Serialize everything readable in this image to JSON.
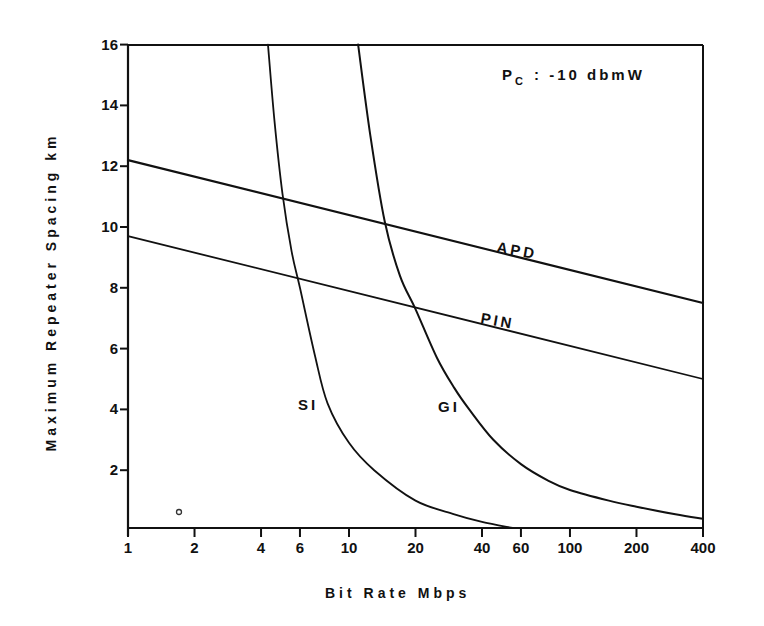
{
  "chart_data": {
    "type": "line",
    "title": "",
    "annotation": {
      "text_main": "P",
      "text_sub": "C",
      "text_rest": ": -10 dbmW"
    },
    "xlabel": "Bit Rate Mbps",
    "ylabel": "Maximum Repeater Spacing km",
    "xscale": "log",
    "xlim": [
      1,
      400
    ],
    "ylim": [
      0,
      16
    ],
    "x_ticks": [
      1,
      2,
      4,
      6,
      10,
      20,
      40,
      60,
      100,
      200,
      400
    ],
    "x_tick_labels": [
      "1",
      "2",
      "4",
      "6",
      "10",
      "20",
      "40",
      "60",
      "100",
      "200",
      "400"
    ],
    "y_ticks": [
      2,
      4,
      6,
      8,
      10,
      12,
      14,
      16
    ],
    "y_tick_labels": [
      "2",
      "4",
      "6",
      "8",
      "10",
      "12",
      "14",
      "16"
    ],
    "grid": false,
    "legend": "none (inline labels)",
    "series": [
      {
        "name": "APD",
        "x": [
          1,
          400
        ],
        "y": [
          12.2,
          7.5
        ]
      },
      {
        "name": "PIN",
        "x": [
          1,
          400
        ],
        "y": [
          9.7,
          5.0
        ]
      },
      {
        "name": "SI",
        "x": [
          4.3,
          4.6,
          5.0,
          5.5,
          6.0,
          7.0,
          8.0,
          10,
          13,
          20,
          30,
          40,
          55
        ],
        "y": [
          16,
          13.5,
          11.1,
          9.2,
          8.0,
          5.8,
          4.2,
          2.9,
          2.0,
          1.0,
          0.55,
          0.3,
          0.1
        ]
      },
      {
        "name": "GI",
        "x": [
          11,
          12.5,
          14.5,
          17,
          20,
          25,
          30,
          35,
          45,
          60,
          80,
          100,
          150,
          200,
          300,
          400
        ],
        "y": [
          16,
          13.0,
          10.2,
          8.4,
          7.3,
          5.7,
          4.7,
          4.0,
          3.0,
          2.2,
          1.65,
          1.35,
          1.0,
          0.8,
          0.55,
          0.4
        ]
      }
    ],
    "marks": [
      {
        "type": "small-circle",
        "x": 1.7,
        "y": 0.5
      }
    ]
  }
}
